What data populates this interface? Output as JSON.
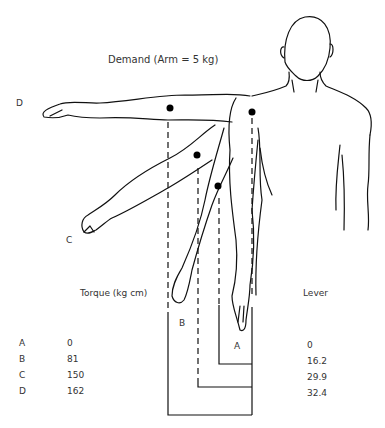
{
  "title": "Demand (Arm = 5 kg)",
  "positions": {
    "D": "D",
    "C": "C",
    "B": "B",
    "A": "A"
  },
  "table": {
    "torque_header": "Torque (kg cm)",
    "lever_header": "Lever",
    "rows": [
      {
        "label": "A",
        "torque": "0",
        "lever": "0"
      },
      {
        "label": "B",
        "torque": "81",
        "lever": "16.2"
      },
      {
        "label": "C",
        "torque": "150",
        "lever": "29.9"
      },
      {
        "label": "D",
        "torque": "162",
        "lever": "32.4"
      }
    ]
  }
}
